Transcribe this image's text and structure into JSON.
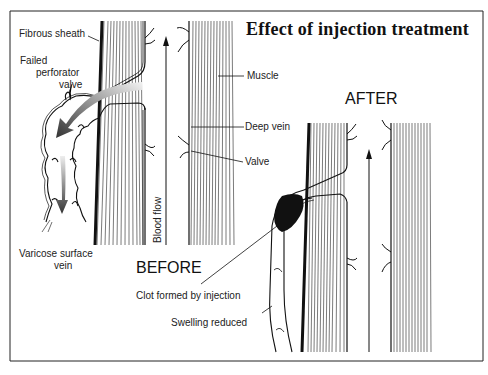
{
  "title": "Effect of injection treatment",
  "panels": {
    "before": {
      "label": "BEFORE"
    },
    "after": {
      "label": "AFTER"
    }
  },
  "labels": {
    "fibrous_sheath": "Fibrous sheath",
    "failed_perforator_valve_line1": "Failed",
    "failed_perforator_valve_line2": "perforator",
    "failed_perforator_valve_line3": "valve",
    "muscle": "Muscle",
    "deep_vein": "Deep vein",
    "valve": "Valve",
    "blood_flow": "Blood flow",
    "varicose_surface_vein_line1": "Varicose surface",
    "varicose_surface_vein_line2": "vein",
    "clot_formed": "Clot formed by injection",
    "swelling_reduced": "Swelling reduced"
  },
  "colors": {
    "ink": "#111111",
    "background": "#ffffff",
    "arrow_gradient_dark": "#333333",
    "arrow_gradient_light": "#dddddd"
  }
}
